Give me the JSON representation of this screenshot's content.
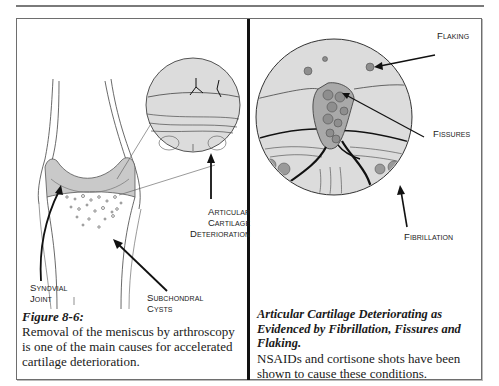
{
  "page": {
    "top_rule": true
  },
  "left_panel": {
    "labels": {
      "articular_cartilage_deterioration": [
        "Articular",
        "Cartilage",
        "Deterioration"
      ],
      "synovial_joint": [
        "Synovial",
        "Joint"
      ],
      "subchondral_cysts": [
        "Subchondral",
        "Cysts"
      ]
    },
    "caption": {
      "title": "Figure 8-6:",
      "body": "Removal of the meniscus by arthroscopy is one of the main causes for accelerated cartilage deterioration."
    }
  },
  "right_panel": {
    "labels": {
      "flaking": "Flaking",
      "fissures": "Fissures",
      "fibrillation": "Fibrillation"
    },
    "caption": {
      "title": "Articular Cartilage Deteriorating as Evidenced by Fibrillation, Fissures and Flaking.",
      "body": "NSAIDs and cortisone shots have been shown to cause these conditions."
    }
  },
  "colors": {
    "cartilage_fill": "#c9c9c9",
    "circle_fill": "#dcdcdc",
    "ink": "#111111",
    "frame": "#6e6e6e"
  }
}
